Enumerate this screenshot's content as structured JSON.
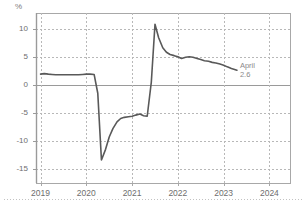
{
  "chart_data": {
    "type": "line",
    "title": "",
    "subtitle": "",
    "xlabel": "",
    "ylabel": "%",
    "unit_label": "%",
    "grid": true,
    "legend": "none",
    "xlim": [
      2018.9,
      2024.45
    ],
    "ylim": [
      -17.5,
      12.8
    ],
    "yticks": [
      10,
      5,
      0,
      -5,
      -10,
      -15
    ],
    "ytick_labels": [
      "10",
      "5",
      "0",
      "-5",
      "-10",
      "-15"
    ],
    "xticks": [
      2019,
      2020,
      2021,
      2022,
      2023,
      2024
    ],
    "xtick_labels": [
      "2019",
      "2020",
      "2021",
      "2022",
      "2023",
      "2024"
    ],
    "zero_line": 0,
    "line_color": "#595959",
    "grid_color": "#b8b8b8",
    "axis_color": "#a8a8a8",
    "annotations": [
      {
        "name": "last-point-label",
        "label_line1": "April",
        "label_line2": "2.6",
        "x": 2023.29,
        "y": 2.6
      }
    ],
    "series": [
      {
        "name": "series-1",
        "x": [
          2019.0,
          2019.08,
          2019.17,
          2019.25,
          2019.33,
          2019.42,
          2019.5,
          2019.58,
          2019.67,
          2019.75,
          2019.83,
          2019.92,
          2020.0,
          2020.08,
          2020.17,
          2020.25,
          2020.33,
          2020.42,
          2020.5,
          2020.58,
          2020.67,
          2020.75,
          2020.83,
          2020.92,
          2021.0,
          2021.08,
          2021.17,
          2021.25,
          2021.33,
          2021.42,
          2021.5,
          2021.58,
          2021.67,
          2021.75,
          2021.83,
          2021.92,
          2022.0,
          2022.08,
          2022.17,
          2022.25,
          2022.33,
          2022.42,
          2022.5,
          2022.58,
          2022.67,
          2022.75,
          2022.83,
          2022.92,
          2023.0,
          2023.08,
          2023.17,
          2023.29
        ],
        "y": [
          1.9,
          2.0,
          1.9,
          1.85,
          1.8,
          1.8,
          1.8,
          1.8,
          1.8,
          1.8,
          1.8,
          1.85,
          1.9,
          1.9,
          1.85,
          -1.5,
          -13.4,
          -11.5,
          -9.3,
          -7.8,
          -6.6,
          -6.0,
          -5.8,
          -5.7,
          -5.6,
          -5.4,
          -5.2,
          -5.5,
          -5.6,
          0.5,
          10.8,
          8.4,
          6.6,
          5.8,
          5.4,
          5.2,
          5.0,
          4.7,
          4.9,
          5.0,
          4.9,
          4.7,
          4.5,
          4.3,
          4.2,
          4.0,
          3.9,
          3.7,
          3.5,
          3.2,
          2.9,
          2.6
        ]
      }
    ]
  }
}
